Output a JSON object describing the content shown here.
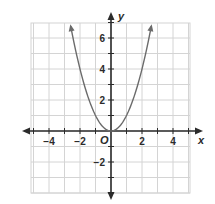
{
  "chart_data": {
    "type": "line",
    "title": "",
    "xlabel": "x",
    "ylabel": "y",
    "origin_label": "O",
    "xlim": [
      -5,
      5
    ],
    "ylim": [
      -4,
      7
    ],
    "grid": true,
    "x_ticks": [
      -4,
      -2,
      2,
      4
    ],
    "y_ticks": [
      -2,
      2,
      4,
      6
    ],
    "x_tick_labels": [
      "−4",
      "−2",
      "2",
      "4"
    ],
    "y_tick_labels": [
      "−2",
      "2",
      "4",
      "6"
    ],
    "series": [
      {
        "name": "y = x^2",
        "equation": "y = x^2",
        "x": [
          -2.6,
          -2,
          -1.5,
          -1,
          -0.5,
          0,
          0.5,
          1,
          1.5,
          2,
          2.6
        ],
        "y": [
          6.76,
          4,
          2.25,
          1,
          0.25,
          0,
          0.25,
          1,
          2.25,
          4,
          6.76
        ],
        "arrows_at_ends": true,
        "color": "#6b6b6b"
      }
    ]
  }
}
